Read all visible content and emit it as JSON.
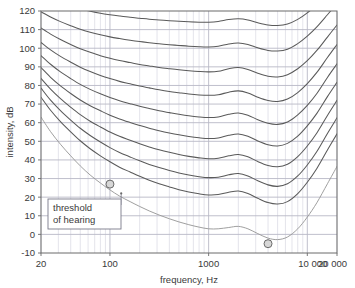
{
  "chart_data": {
    "type": "line",
    "title": "",
    "xlabel": "frequency, Hz",
    "ylabel": "intensity, dB",
    "xscale": "log",
    "xlim": [
      20,
      20000
    ],
    "ylim": [
      -10,
      120
    ],
    "grid": true,
    "legend": "none",
    "xticks": [
      20,
      100,
      1000,
      10000,
      20000
    ],
    "xtick_labels": [
      "20",
      "100",
      "1000",
      "10 000",
      "20 000"
    ],
    "yticks": [
      -10,
      0,
      10,
      20,
      30,
      40,
      50,
      60,
      70,
      80,
      90,
      100,
      110,
      120
    ],
    "ytick_labels": [
      "-10",
      "0",
      "10",
      "20",
      "30",
      "40",
      "50",
      "60",
      "70",
      "80",
      "90",
      "100",
      "110",
      "120"
    ],
    "x": [
      20,
      25,
      31.5,
      40,
      50,
      63,
      80,
      100,
      125,
      160,
      200,
      250,
      315,
      400,
      500,
      630,
      800,
      1000,
      1250,
      1600,
      2000,
      2500,
      3150,
      4000,
      5000,
      6300,
      8000,
      10000,
      12500,
      16000,
      20000
    ],
    "series": [
      {
        "name": "120 phon",
        "values": [
          128.4,
          126.2,
          124.2,
          122.5,
          121.1,
          119.9,
          118.8,
          118.0,
          117.3,
          116.6,
          116.1,
          115.6,
          115.2,
          114.8,
          114.5,
          114.2,
          114.0,
          114.0,
          114.4,
          115.4,
          115.8,
          115.2,
          113.7,
          112.5,
          112.2,
          113.0,
          115.5,
          119.0,
          123.4,
          129.0,
          134.0
        ]
      },
      {
        "name": "110 phon",
        "values": [
          119.5,
          116.8,
          114.3,
          112.1,
          110.2,
          108.6,
          107.2,
          106.1,
          105.2,
          104.3,
          103.6,
          103.0,
          102.4,
          101.9,
          101.5,
          101.1,
          100.8,
          100.7,
          101.1,
          102.3,
          102.8,
          102.0,
          100.2,
          98.8,
          98.5,
          99.5,
          102.5,
          106.5,
          111.5,
          118.0,
          124.0
        ]
      },
      {
        "name": "100 phon",
        "values": [
          110.9,
          107.6,
          104.7,
          102.0,
          99.7,
          97.8,
          96.0,
          94.6,
          93.4,
          92.3,
          91.3,
          90.5,
          89.7,
          89.0,
          88.4,
          87.9,
          87.5,
          87.3,
          87.6,
          89.0,
          89.6,
          88.6,
          86.6,
          85.0,
          84.6,
          85.8,
          89.0,
          93.3,
          98.8,
          106.0,
          112.5
        ]
      },
      {
        "name": "90 phon",
        "values": [
          103.1,
          99.1,
          95.6,
          92.5,
          89.8,
          87.5,
          85.4,
          83.7,
          82.2,
          80.9,
          79.7,
          78.7,
          77.7,
          76.8,
          76.1,
          75.4,
          74.9,
          74.7,
          75.0,
          76.4,
          77.1,
          76.0,
          73.7,
          71.9,
          71.4,
          72.7,
          76.2,
          81.0,
          87.0,
          95.0,
          102.0
        ]
      },
      {
        "name": "80 phon",
        "values": [
          96.0,
          91.4,
          87.3,
          83.7,
          80.6,
          77.9,
          75.5,
          73.5,
          71.8,
          70.2,
          68.8,
          67.6,
          66.4,
          65.4,
          64.5,
          63.7,
          63.1,
          62.8,
          63.1,
          64.5,
          65.2,
          64.0,
          61.6,
          59.7,
          59.1,
          60.4,
          64.2,
          69.3,
          75.7,
          84.3,
          91.6
        ]
      },
      {
        "name": "70 phon",
        "values": [
          89.6,
          84.4,
          79.8,
          75.7,
          72.2,
          69.1,
          66.4,
          64.0,
          62.0,
          60.1,
          58.5,
          57.0,
          55.7,
          54.5,
          53.5,
          52.6,
          51.9,
          51.5,
          51.8,
          53.2,
          53.9,
          52.7,
          50.2,
          48.2,
          47.5,
          48.9,
          52.8,
          58.3,
          65.0,
          74.0,
          81.7
        ]
      },
      {
        "name": "60 phon",
        "values": [
          83.8,
          78.0,
          72.9,
          68.3,
          64.3,
          60.8,
          57.7,
          55.0,
          52.7,
          50.6,
          48.7,
          47.0,
          45.5,
          44.1,
          42.9,
          41.9,
          41.1,
          40.6,
          40.9,
          42.2,
          42.9,
          41.7,
          39.1,
          37.0,
          36.3,
          37.7,
          41.8,
          47.5,
          54.5,
          63.9,
          72.0
        ]
      },
      {
        "name": "50 phon",
        "values": [
          78.6,
          72.1,
          66.5,
          61.4,
          57.0,
          53.1,
          49.6,
          46.6,
          44.0,
          41.6,
          39.5,
          37.6,
          35.9,
          34.3,
          33.0,
          31.9,
          31.0,
          30.5,
          30.7,
          32.0,
          32.7,
          31.4,
          28.8,
          26.6,
          25.8,
          27.2,
          31.4,
          37.3,
          44.5,
          54.2,
          62.6
        ]
      },
      {
        "name": "40 phon",
        "values": [
          73.7,
          66.7,
          60.6,
          55.1,
          50.3,
          46.0,
          42.2,
          39.0,
          36.1,
          33.5,
          31.2,
          29.1,
          27.2,
          25.5,
          24.0,
          22.8,
          21.8,
          21.2,
          21.4,
          22.6,
          23.3,
          22.0,
          19.4,
          17.1,
          16.3,
          17.6,
          21.9,
          28.0,
          35.4,
          45.3,
          54.0
        ]
      },
      {
        "name": "10 phon / threshold of hearing",
        "values": [
          63.0,
          55.2,
          48.4,
          42.2,
          36.8,
          31.9,
          27.6,
          23.9,
          20.6,
          17.6,
          15.0,
          12.6,
          10.4,
          8.4,
          6.7,
          5.2,
          3.9,
          3.0,
          3.0,
          3.7,
          4.3,
          3.0,
          0.4,
          -2.0,
          -2.8,
          -1.4,
          3.0,
          9.3,
          17.0,
          27.2,
          36.5
        ]
      }
    ],
    "markers": [
      {
        "x": 100,
        "y": 27,
        "label": "threshold of hearing marker"
      },
      {
        "x": 4000,
        "y": -5,
        "label": "threshold minimum marker"
      }
    ],
    "annotations": [
      {
        "text_line1": "threshold",
        "text_line2": "of hearing",
        "target_x": 130,
        "target_y": 22
      }
    ],
    "colors": {
      "curve": "#5a5a5a",
      "threshold_curve": "#9a9a9a",
      "grid_major": "#b9b9c6",
      "grid_minor": "#d9d9e2",
      "axis": "#6a6a6a",
      "text": "#3a3a3a",
      "marker_fill": "#d7d7d7",
      "marker_stroke": "#6a6a6a",
      "annotation_box_bg": "#ffffff",
      "annotation_box_border": "#7a7a8a",
      "background": "#ffffff"
    }
  }
}
